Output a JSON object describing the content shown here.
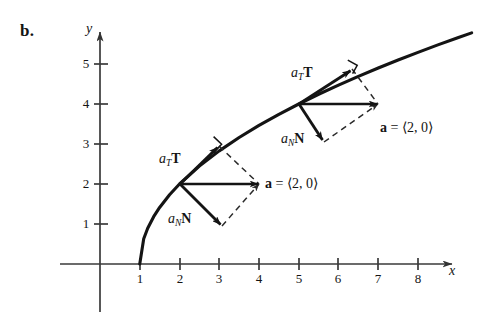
{
  "figure": {
    "panel_letter": "b.",
    "background_color": "#ffffff",
    "ink_color": "#141414",
    "width": 489,
    "height": 325
  },
  "axes": {
    "x_axis_label": "x",
    "y_axis_label": "y",
    "x_ticks": [
      "1",
      "2",
      "3",
      "4",
      "5",
      "6",
      "7",
      "8"
    ],
    "y_ticks": [
      "1",
      "2",
      "3",
      "4",
      "5"
    ],
    "x_origin_px": 100,
    "y_origin_px": 264,
    "px_per_unit_x": 39.75,
    "px_per_unit_y": 40,
    "x_range": [
      -0.6,
      9.4
    ],
    "y_range": [
      -1.3,
      6.1
    ],
    "grid": "off"
  },
  "chart_data": {
    "type": "line",
    "title": "",
    "xlabel": "x",
    "ylabel": "y",
    "xlim": [
      -0.6,
      9.4
    ],
    "ylim": [
      -1.3,
      6.1
    ],
    "grid": false,
    "legend": "none",
    "curve": {
      "name": "trajectory",
      "equation": "y = 2*sqrt(x - 1)",
      "x": [
        1,
        1.1,
        1.2,
        1.35,
        1.5,
        1.75,
        2,
        2.5,
        3,
        3.5,
        4,
        4.5,
        5,
        5.5,
        6,
        6.5,
        7,
        7.5,
        8,
        8.5,
        9,
        9.35
      ],
      "y": [
        0,
        0.632,
        0.894,
        1.183,
        1.414,
        1.732,
        2,
        2.449,
        2.828,
        3.162,
        3.464,
        3.742,
        4,
        4.243,
        4.472,
        4.69,
        4.899,
        5.099,
        5.292,
        5.477,
        5.657,
        5.779
      ]
    },
    "annotations": [
      {
        "name": "lower-vector-triad",
        "base_point": [
          2,
          2
        ],
        "vectors": [
          {
            "label": "a_T T",
            "tip": [
              3.0,
              2.95
            ],
            "style": "solid-arrow"
          },
          {
            "label": "a_N N",
            "tip": [
              3.08,
              0.95
            ],
            "style": "solid-arrow"
          },
          {
            "label": "a = <2, 0>",
            "tip": [
              4,
              2
            ],
            "style": "solid-arrow"
          }
        ],
        "dashed_parallelogram": [
          [
            3.0,
            2.95
          ],
          [
            4,
            2
          ],
          [
            3.08,
            0.95
          ]
        ],
        "right_angle_mark_at": [
          3.0,
          2.95
        ]
      },
      {
        "name": "upper-vector-triad",
        "base_point": [
          5,
          4
        ],
        "vectors": [
          {
            "label": "a_T T",
            "tip": [
              6.35,
              4.87
            ],
            "style": "solid-arrow"
          },
          {
            "label": "a_N N",
            "tip": [
              5.63,
              3.04
            ],
            "style": "solid-arrow"
          },
          {
            "label": "a = <2, 0>",
            "tip": [
              7,
              4
            ],
            "style": "solid-arrow"
          }
        ],
        "dashed_parallelogram": [
          [
            6.35,
            4.87
          ],
          [
            7,
            4
          ],
          [
            5.63,
            3.04
          ]
        ],
        "right_angle_mark_at": [
          6.35,
          4.87
        ]
      }
    ]
  },
  "labels": {
    "lower": {
      "tangential": {
        "a": "a",
        "sub": "T",
        "vec": "T"
      },
      "normal": {
        "a": "a",
        "sub": "N",
        "vec": "N"
      },
      "acceleration": {
        "vec": "a",
        "eq": " = ",
        "value": "⟨2, 0⟩"
      }
    },
    "upper": {
      "tangential": {
        "a": "a",
        "sub": "T",
        "vec": "T"
      },
      "normal": {
        "a": "a",
        "sub": "N",
        "vec": "N"
      },
      "acceleration": {
        "vec": "a",
        "eq": " = ",
        "value": "⟨2, 0⟩"
      }
    }
  }
}
